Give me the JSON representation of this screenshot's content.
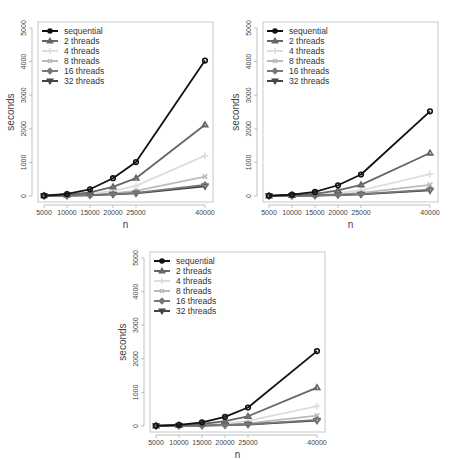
{
  "chart_data": [
    {
      "type": "line",
      "title": "",
      "xlabel": "n",
      "ylabel": "seconds",
      "x": [
        5000,
        10000,
        15000,
        20000,
        25000,
        40000
      ],
      "x_ticks": [
        "5000",
        "10000",
        "15000",
        "20000",
        "25000",
        "40000"
      ],
      "y_ticks": [
        "0",
        "1000",
        "2000",
        "3000",
        "4000",
        "5000"
      ],
      "ylim": [
        0,
        5000
      ],
      "grid": false,
      "legend_position": "top-left",
      "series": [
        {
          "name": "sequential",
          "marker": "circle",
          "color": "#111111",
          "values": [
            10,
            60,
            200,
            530,
            1010,
            4030
          ]
        },
        {
          "name": "2 threads",
          "marker": "triangle",
          "color": "#666666",
          "values": [
            8,
            35,
            110,
            270,
            530,
            2120
          ]
        },
        {
          "name": "4 threads",
          "marker": "plus",
          "color": "#dddddd",
          "values": [
            6,
            20,
            60,
            150,
            300,
            1200
          ]
        },
        {
          "name": "8 threads",
          "marker": "x",
          "color": "#bbbbbb",
          "values": [
            5,
            12,
            35,
            80,
            150,
            580
          ]
        },
        {
          "name": "16 threads",
          "marker": "diamond",
          "color": "#777777",
          "values": [
            4,
            10,
            25,
            55,
            90,
            330
          ]
        },
        {
          "name": "32 threads",
          "marker": "triangle-down",
          "color": "#444444",
          "values": [
            4,
            9,
            22,
            50,
            80,
            290
          ]
        }
      ]
    },
    {
      "type": "line",
      "title": "",
      "xlabel": "n",
      "ylabel": "seconds",
      "x": [
        5000,
        10000,
        15000,
        20000,
        25000,
        40000
      ],
      "x_ticks": [
        "5000",
        "10000",
        "15000",
        "20000",
        "25000",
        "40000"
      ],
      "y_ticks": [
        "0",
        "1000",
        "2000",
        "3000",
        "4000",
        "5000"
      ],
      "ylim": [
        0,
        5000
      ],
      "grid": false,
      "legend_position": "top-left",
      "series": [
        {
          "name": "sequential",
          "marker": "circle",
          "color": "#111111",
          "values": [
            8,
            40,
            120,
            320,
            640,
            2520
          ]
        },
        {
          "name": "2 threads",
          "marker": "triangle",
          "color": "#666666",
          "values": [
            6,
            22,
            65,
            165,
            330,
            1280
          ]
        },
        {
          "name": "4 threads",
          "marker": "plus",
          "color": "#dddddd",
          "values": [
            5,
            14,
            38,
            90,
            170,
            650
          ]
        },
        {
          "name": "8 threads",
          "marker": "x",
          "color": "#bbbbbb",
          "values": [
            4,
            10,
            22,
            50,
            90,
            330
          ]
        },
        {
          "name": "16 threads",
          "marker": "diamond",
          "color": "#777777",
          "values": [
            4,
            8,
            16,
            32,
            55,
            190
          ]
        },
        {
          "name": "32 threads",
          "marker": "triangle-down",
          "color": "#444444",
          "values": [
            4,
            8,
            15,
            30,
            50,
            170
          ]
        }
      ]
    },
    {
      "type": "line",
      "title": "",
      "xlabel": "n",
      "ylabel": "seconds",
      "x": [
        5000,
        10000,
        15000,
        20000,
        25000,
        40000
      ],
      "x_ticks": [
        "5000",
        "10000",
        "15000",
        "20000",
        "25000",
        "40000"
      ],
      "y_ticks": [
        "0",
        "1000",
        "2000",
        "3000",
        "4000",
        "5000"
      ],
      "ylim": [
        0,
        5000
      ],
      "grid": false,
      "legend_position": "top-left",
      "series": [
        {
          "name": "sequential",
          "marker": "circle",
          "color": "#111111",
          "values": [
            8,
            35,
            110,
            270,
            550,
            2230
          ]
        },
        {
          "name": "2 threads",
          "marker": "triangle",
          "color": "#666666",
          "values": [
            6,
            20,
            60,
            145,
            290,
            1140
          ]
        },
        {
          "name": "4 threads",
          "marker": "plus",
          "color": "#dddddd",
          "values": [
            5,
            13,
            35,
            80,
            150,
            590
          ]
        },
        {
          "name": "8 threads",
          "marker": "x",
          "color": "#bbbbbb",
          "values": [
            4,
            10,
            20,
            45,
            80,
            310
          ]
        },
        {
          "name": "16 threads",
          "marker": "diamond",
          "color": "#777777",
          "values": [
            4,
            8,
            15,
            30,
            50,
            180
          ]
        },
        {
          "name": "32 threads",
          "marker": "triangle-down",
          "color": "#444444",
          "values": [
            4,
            7,
            14,
            28,
            45,
            160
          ]
        }
      ]
    }
  ]
}
